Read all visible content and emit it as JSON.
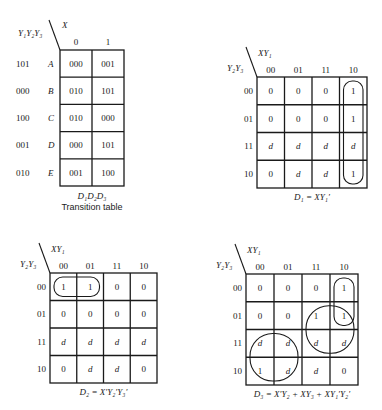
{
  "transition_table": {
    "row_var_label": "Y₁Y₂Y₃",
    "col_var_label": "X",
    "col_headers": [
      "0",
      "1"
    ],
    "rows": [
      {
        "state_code": "101",
        "state": "A",
        "cells": [
          "000",
          "001"
        ]
      },
      {
        "state_code": "000",
        "state": "B",
        "cells": [
          "010",
          "101"
        ]
      },
      {
        "state_code": "100",
        "state": "C",
        "cells": [
          "010",
          "000"
        ]
      },
      {
        "state_code": "001",
        "state": "D",
        "cells": [
          "000",
          "101"
        ]
      },
      {
        "state_code": "010",
        "state": "E",
        "cells": [
          "001",
          "100"
        ]
      }
    ],
    "caption_vars": "D₁D₂D₃",
    "caption": "Transition table"
  },
  "maps": [
    {
      "id": "d1",
      "col_var_label": "XY₁",
      "row_var_label": "Y₂Y₃",
      "col_headers": [
        "00",
        "01",
        "11",
        "10"
      ],
      "row_headers": [
        "00",
        "01",
        "11",
        "10"
      ],
      "cells": [
        [
          "0",
          "0",
          "0",
          "1"
        ],
        [
          "0",
          "0",
          "0",
          "1"
        ],
        [
          "d",
          "d",
          "d",
          "d"
        ],
        [
          "0",
          "d",
          "d",
          "1"
        ]
      ],
      "groups": [
        {
          "rows": [
            0,
            3
          ],
          "cols": [
            3,
            3
          ]
        }
      ],
      "equation": "D₁ = XY₁′"
    },
    {
      "id": "d2",
      "col_var_label": "XY₁",
      "row_var_label": "Y₂Y₃",
      "col_headers": [
        "00",
        "01",
        "11",
        "10"
      ],
      "row_headers": [
        "00",
        "01",
        "11",
        "10"
      ],
      "cells": [
        [
          "1",
          "1",
          "0",
          "0"
        ],
        [
          "0",
          "0",
          "0",
          "0"
        ],
        [
          "d",
          "d",
          "d",
          "d"
        ],
        [
          "0",
          "d",
          "d",
          "0"
        ]
      ],
      "groups": [
        {
          "rows": [
            0,
            0
          ],
          "cols": [
            0,
            1
          ]
        }
      ],
      "equation": "D₂ = X′Y₂′Y₃′"
    },
    {
      "id": "d3",
      "col_var_label": "XY₁",
      "row_var_label": "Y₂Y₃",
      "col_headers": [
        "00",
        "01",
        "11",
        "10"
      ],
      "row_headers": [
        "00",
        "01",
        "11",
        "10"
      ],
      "cells": [
        [
          "0",
          "0",
          "0",
          "1"
        ],
        [
          "0",
          "0",
          "1",
          "1"
        ],
        [
          "d",
          "d",
          "d",
          "d"
        ],
        [
          "1",
          "d",
          "d",
          "0"
        ]
      ],
      "groups": [
        {
          "rows": [
            0,
            1
          ],
          "cols": [
            3,
            3
          ]
        },
        {
          "rows": [
            1,
            2
          ],
          "cols": [
            2,
            3
          ]
        },
        {
          "rows": [
            2,
            3
          ],
          "cols": [
            0,
            1
          ]
        }
      ],
      "equation": "D₃ = X′Y₂ + XY₃ + XY₁′Y₂′"
    }
  ]
}
